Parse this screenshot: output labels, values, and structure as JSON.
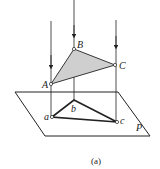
{
  "diagram": {
    "caption": "(a)",
    "plane_label": "P",
    "points_space": [
      {
        "label": "A",
        "x": 51,
        "y": 84
      },
      {
        "label": "B",
        "x": 74,
        "y": 49
      },
      {
        "label": "C",
        "x": 115,
        "y": 65
      }
    ],
    "points_projection": [
      {
        "label": "a",
        "x": 52,
        "y": 117
      },
      {
        "label": "b",
        "x": 74,
        "y": 100
      },
      {
        "label": "c",
        "x": 117,
        "y": 122
      }
    ],
    "colors": {
      "line": "#222222",
      "triangle_fill": "#cfcfcf"
    }
  }
}
